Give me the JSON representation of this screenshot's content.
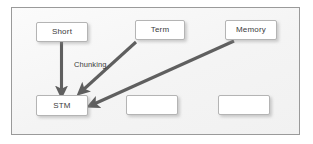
{
  "diagram": {
    "panel": {
      "background_color": "#f4f4f4",
      "border_color": "#9a9a9a"
    },
    "style": {
      "node_fill": "#ffffff",
      "node_border": "#b4b4b4",
      "arrow_color": "#5f5f5f",
      "text_color": "#3b3b3b"
    },
    "nodes": [
      {
        "id": "short",
        "label": "Short",
        "row": "top",
        "col": 1
      },
      {
        "id": "term",
        "label": "Term",
        "row": "top",
        "col": 2
      },
      {
        "id": "memory",
        "label": "Memory",
        "row": "top",
        "col": 3
      },
      {
        "id": "stm",
        "label": "STM",
        "row": "bottom",
        "col": 1
      },
      {
        "id": "empty1",
        "label": "",
        "row": "bottom",
        "col": 2
      },
      {
        "id": "empty2",
        "label": "",
        "row": "bottom",
        "col": 3
      }
    ],
    "edges": [
      {
        "id": "short-to-stm",
        "from": "short",
        "to": "stm",
        "label": ""
      },
      {
        "id": "term-to-stm",
        "from": "term",
        "to": "stm",
        "label": "Chunking"
      },
      {
        "id": "memory-to-stm",
        "from": "memory",
        "to": "stm",
        "label": ""
      }
    ],
    "labels": {
      "chunking": "Chunking"
    }
  }
}
